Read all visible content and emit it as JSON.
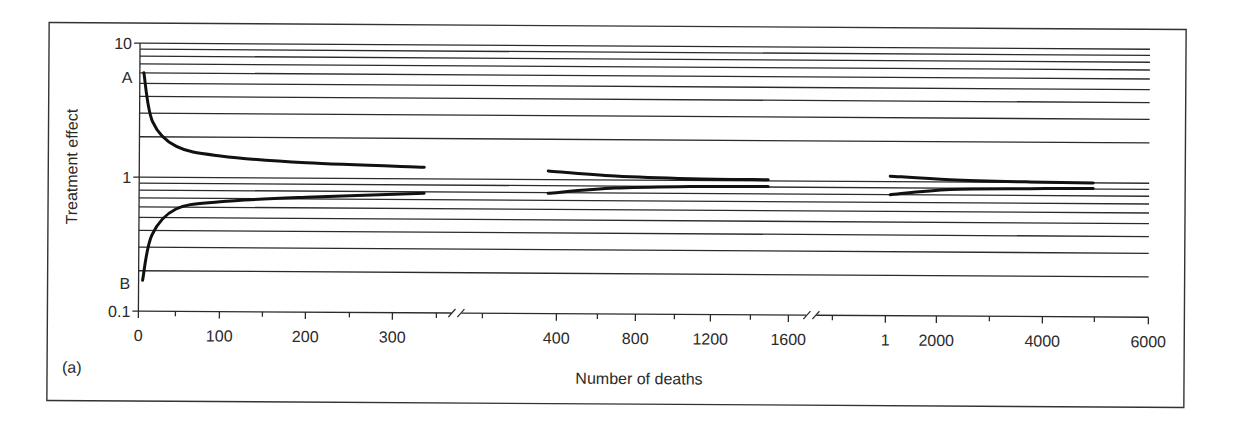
{
  "figure": {
    "panel_label": "(a)",
    "xlabel": "Number of deaths",
    "ylabel": "Treatment effect",
    "point_labels": {
      "upper": "A",
      "lower": "B"
    }
  },
  "chart_data": {
    "type": "line",
    "title": "",
    "panel_label": "(a)",
    "xlabel": "Number of deaths",
    "ylabel": "Treatment effect",
    "yscale": "log",
    "ylim": [
      0.1,
      10
    ],
    "y_tick_labels": [
      "0.1",
      "1",
      "10"
    ],
    "y_gridlines": [
      0.2,
      0.3,
      0.4,
      0.5,
      0.6,
      0.7,
      0.8,
      0.9,
      1,
      2,
      3,
      4,
      5,
      6,
      7,
      8,
      9,
      10
    ],
    "grid": true,
    "x_axis_segments": [
      {
        "range": [
          0,
          350
        ],
        "tick_labels": [
          "0",
          "100",
          "200",
          "300"
        ],
        "minor_ticks": [
          50,
          150,
          250,
          350
        ]
      },
      {
        "range": [
          200,
          1600
        ],
        "tick_labels": [
          "400",
          "800",
          "1200",
          "1600"
        ],
        "minor_ticks": [
          200,
          600,
          1000,
          1400
        ]
      },
      {
        "range": [
          0,
          6000
        ],
        "tick_labels": [
          "1",
          "2000",
          "4000",
          "6000"
        ],
        "minor_ticks": [
          0,
          3000,
          5000
        ]
      }
    ],
    "axis_breaks": [
      "between 350 and 200",
      "between 1600 and next segment"
    ],
    "annotations": [
      {
        "text": "A",
        "x": 0,
        "y": 6
      },
      {
        "text": "B",
        "x": 0,
        "y": 0.17
      }
    ],
    "series": [
      {
        "name": "upper boundary (segment 1)",
        "x": [
          5,
          20,
          50,
          100,
          200,
          330
        ],
        "y": [
          6.0,
          2.6,
          1.7,
          1.45,
          1.3,
          1.22
        ]
      },
      {
        "name": "lower boundary (segment 1)",
        "x": [
          5,
          20,
          50,
          100,
          200,
          330
        ],
        "y": [
          0.17,
          0.37,
          0.58,
          0.66,
          0.72,
          0.78
        ]
      },
      {
        "name": "upper boundary (segment 2)",
        "x": [
          350,
          600,
          1000,
          1500
        ],
        "y": [
          1.16,
          1.07,
          1.03,
          1.02
        ]
      },
      {
        "name": "lower boundary (segment 2)",
        "x": [
          350,
          600,
          1000,
          1500
        ],
        "y": [
          0.79,
          0.87,
          0.9,
          0.91
        ]
      },
      {
        "name": "upper boundary (segment 3)",
        "x": [
          1000,
          2000,
          3500,
          5000
        ],
        "y": [
          1.1,
          1.04,
          1.01,
          1.0
        ]
      },
      {
        "name": "lower boundary (segment 3)",
        "x": [
          1000,
          2000,
          3500,
          5000
        ],
        "y": [
          0.8,
          0.88,
          0.9,
          0.91
        ]
      }
    ]
  }
}
